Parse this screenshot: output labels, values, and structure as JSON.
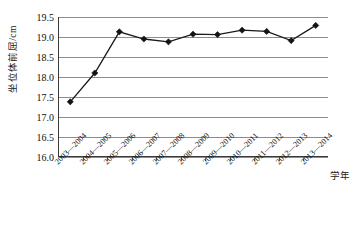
{
  "chart_data": {
    "type": "line",
    "title": "",
    "xlabel": "学年",
    "ylabel": "坐位体前屈/cm",
    "ylim": [
      16.0,
      19.5
    ],
    "ytick_labels": [
      "19.5",
      "19.0",
      "18.5",
      "18.0",
      "17.5",
      "17.0",
      "16.5",
      "16.0"
    ],
    "ytick_values": [
      19.5,
      19.0,
      18.5,
      18.0,
      17.5,
      17.0,
      16.5,
      16.0
    ],
    "grid": true,
    "legend": "none",
    "marker": "diamond",
    "line_color": "#141414",
    "grid_color": "#8d8d8d",
    "categories": [
      "2003—2004",
      "2004—2005",
      "2005—2006",
      "2006—2007",
      "2007—2008",
      "2008—2009",
      "2009—2010",
      "2010—2011",
      "2011—2012",
      "2012—2013",
      "2013—2014"
    ],
    "values": [
      17.38,
      18.1,
      19.13,
      18.95,
      18.88,
      19.07,
      19.06,
      19.17,
      19.14,
      18.91,
      19.29
    ]
  }
}
